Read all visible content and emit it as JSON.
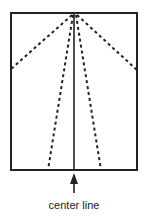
{
  "diagram": {
    "label": "center line",
    "colors": {
      "stroke": "#222222",
      "background": "#ffffff"
    },
    "rectangle": {
      "x": 11,
      "y": 13,
      "width": 126,
      "height": 157
    },
    "center_line": {
      "x": 74,
      "y1": 13,
      "y2": 170
    },
    "apex": {
      "x": 74,
      "y": 14
    },
    "dashed_lines": [
      {
        "name": "left-edge",
        "x2": 11,
        "y2": 69
      },
      {
        "name": "left-bottom",
        "x2": 48,
        "y2": 170
      },
      {
        "name": "right-bottom",
        "x2": 101,
        "y2": 170
      },
      {
        "name": "right-edge",
        "x2": 137,
        "y2": 70
      }
    ],
    "arrow": {
      "x": 74,
      "tip_y": 173,
      "tail_y": 192
    }
  }
}
